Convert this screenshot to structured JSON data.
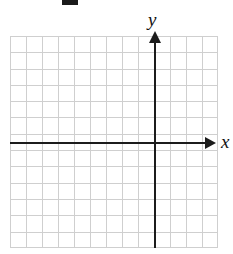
{
  "figure": {
    "title": "",
    "width": 233,
    "height": 254,
    "background_color": "#ffffff"
  },
  "top_mark": {
    "name": "clipped-dash-mark",
    "color": "#1a1a1a"
  },
  "axes": {
    "x_label": "x",
    "y_label": "y",
    "axis_color": "#1c1c1c",
    "grid_color": "#cfcfcf"
  },
  "chart_data": {
    "type": "scatter",
    "title": "",
    "subtitle": "",
    "xlabel": "x",
    "ylabel": "y",
    "series": [
      {
        "name": "",
        "x": [],
        "y": []
      }
    ],
    "categories": [],
    "values": [],
    "xlim": [
      -7,
      6
    ],
    "ylim": [
      -6,
      7
    ],
    "xticks": [],
    "yticks": [],
    "xticklabels": [],
    "yticklabels": [],
    "grid": true,
    "grid_columns": 13,
    "grid_rows": 13,
    "legend": null,
    "legend_position": "none",
    "annotations": []
  }
}
